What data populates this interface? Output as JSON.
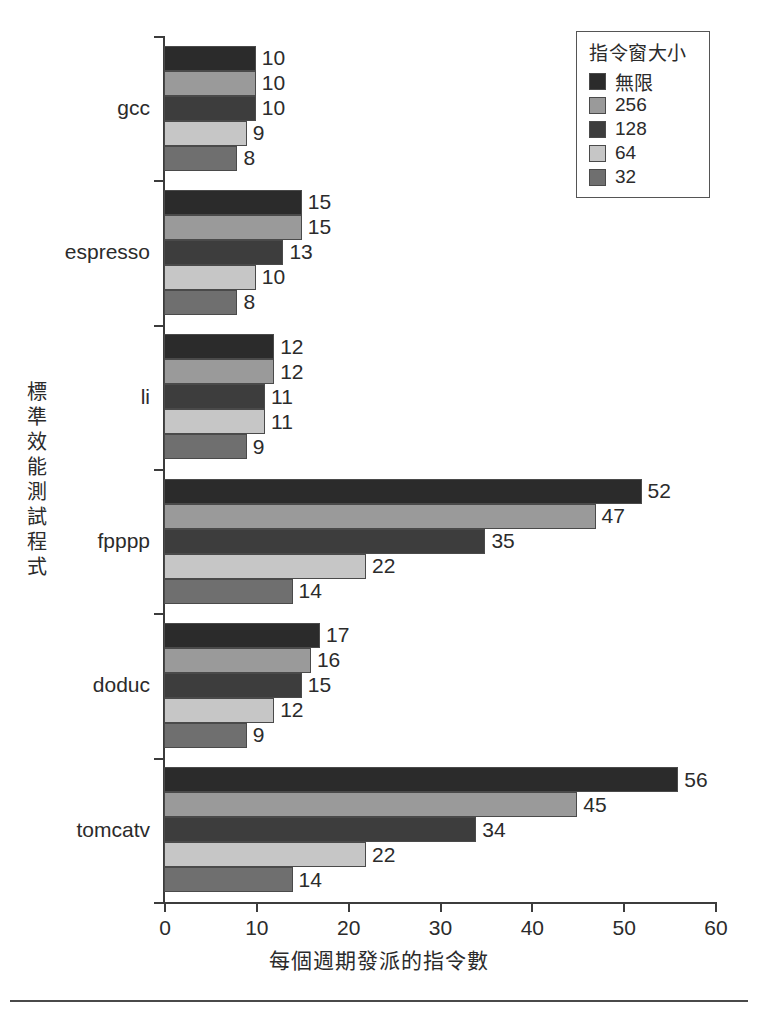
{
  "chart_data": {
    "type": "bar",
    "orientation": "horizontal",
    "title": "",
    "xlabel": "每個週期發派的指令數",
    "ylabel": "標準效能測試程式",
    "xlim": [
      0,
      60
    ],
    "xticks": [
      0,
      10,
      20,
      30,
      40,
      50,
      60
    ],
    "grid": false,
    "legend_position": "top-right",
    "legend_title": "指令窗大小",
    "categories": [
      "gcc",
      "espresso",
      "li",
      "fpppp",
      "doduc",
      "tomcatv"
    ],
    "series": [
      {
        "name": "無限",
        "color": "#2b2b2b",
        "values": [
          10,
          15,
          12,
          52,
          17,
          56
        ]
      },
      {
        "name": "256",
        "color": "#9a9a9a",
        "values": [
          10,
          15,
          12,
          47,
          16,
          45
        ]
      },
      {
        "name": "128",
        "color": "#3d3d3d",
        "values": [
          10,
          13,
          11,
          35,
          15,
          34
        ]
      },
      {
        "name": "64",
        "color": "#c6c6c6",
        "values": [
          9,
          10,
          11,
          22,
          12,
          22
        ]
      },
      {
        "name": "32",
        "color": "#6f6f6f",
        "values": [
          8,
          8,
          9,
          14,
          9,
          14
        ]
      }
    ]
  },
  "axis": {
    "xtick_labels": [
      "0",
      "10",
      "20",
      "30",
      "40",
      "50",
      "60"
    ]
  }
}
